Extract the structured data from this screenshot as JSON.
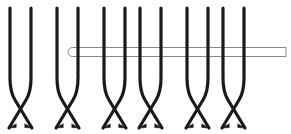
{
  "figure": {
    "width": 291,
    "height": 134,
    "background_color": "#ffffff",
    "stroke_color": "#1a1a1a",
    "stroke_width": 3.2,
    "needle_fill": "#ffffff",
    "needle_stroke": "#8a8a8a",
    "needle_stroke_width": 1.0
  },
  "needle": {
    "name": "horizontal-rod",
    "tip_x": 68,
    "end_x": 286,
    "center_y": 52,
    "thickness": 9,
    "tip_style": "rounded",
    "end_style": "square"
  },
  "chart_data": {
    "type": "diagram",
    "strand_count": 12,
    "pair_count": 6,
    "top_y": 8,
    "bottom_y": 128,
    "straight_until_y": 88,
    "strands": [
      {
        "id": 1,
        "top_x": 10,
        "bottom_x": 31,
        "pair": 1,
        "role": "left"
      },
      {
        "id": 2,
        "top_x": 31,
        "bottom_x": 10,
        "pair": 1,
        "role": "right"
      },
      {
        "id": 3,
        "top_x": 57,
        "bottom_x": 78,
        "pair": 2,
        "role": "left"
      },
      {
        "id": 4,
        "top_x": 78,
        "bottom_x": 57,
        "pair": 2,
        "role": "right"
      },
      {
        "id": 5,
        "top_x": 104,
        "bottom_x": 125,
        "pair": 3,
        "role": "left"
      },
      {
        "id": 6,
        "top_x": 125,
        "bottom_x": 104,
        "pair": 3,
        "role": "right"
      },
      {
        "id": 7,
        "top_x": 140,
        "bottom_x": 161,
        "pair": 4,
        "role": "left"
      },
      {
        "id": 8,
        "top_x": 161,
        "bottom_x": 140,
        "pair": 4,
        "role": "right"
      },
      {
        "id": 9,
        "top_x": 187,
        "bottom_x": 208,
        "pair": 5,
        "role": "left"
      },
      {
        "id": 10,
        "top_x": 208,
        "bottom_x": 187,
        "pair": 5,
        "role": "right"
      },
      {
        "id": 11,
        "top_x": 223,
        "bottom_x": 244,
        "pair": 6,
        "role": "left"
      },
      {
        "id": 12,
        "top_x": 244,
        "bottom_x": 223,
        "pair": 6,
        "role": "right"
      }
    ],
    "pairs": [
      {
        "pair": 1,
        "loop_left_x": 10,
        "loop_right_x": 31,
        "crossing": "X",
        "loop_top": true
      },
      {
        "pair": 2,
        "loop_left_x": 57,
        "loop_right_x": 78,
        "crossing": "X",
        "loop_top": true
      },
      {
        "pair": 3,
        "loop_left_x": 104,
        "loop_right_x": 125,
        "crossing": "X",
        "loop_top": true
      },
      {
        "pair": 4,
        "loop_left_x": 140,
        "loop_right_x": 161,
        "crossing": "X",
        "loop_top": true
      },
      {
        "pair": 5,
        "loop_left_x": 187,
        "loop_right_x": 208,
        "crossing": "X",
        "loop_top": true
      },
      {
        "pair": 6,
        "loop_left_x": 223,
        "loop_right_x": 244,
        "crossing": "X",
        "loop_top": true
      }
    ],
    "xlabel": "",
    "ylabel": "",
    "legend": []
  }
}
